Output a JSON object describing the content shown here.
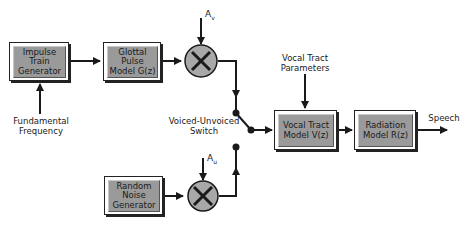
{
  "diagram": {
    "blocks": {
      "impulse_train": "Impulse\nTrain\nGenerator",
      "glottal_pulse": "Glottal Pulse\nModel G(z)",
      "random_noise": "Random\nNoise\nGenerator",
      "vocal_tract": "Vocal Tract\nModel V(z)",
      "radiation": "Radiation\nModel R(z)"
    },
    "labels": {
      "fundamental_frequency": "Fundamental\nFrequency",
      "av": "Av",
      "au": "Au",
      "voiced_unvoiced_switch": "Voiced-Unvoiced\nSwitch",
      "vocal_tract_parameters": "Vocal Tract\nParameters",
      "speech": "Speech"
    },
    "multiplier_symbol": "×",
    "colors": {
      "block_fill": "#9a9a9a",
      "line": "#1a1a1a",
      "multiplier_fill": "#a8a8a8"
    }
  }
}
